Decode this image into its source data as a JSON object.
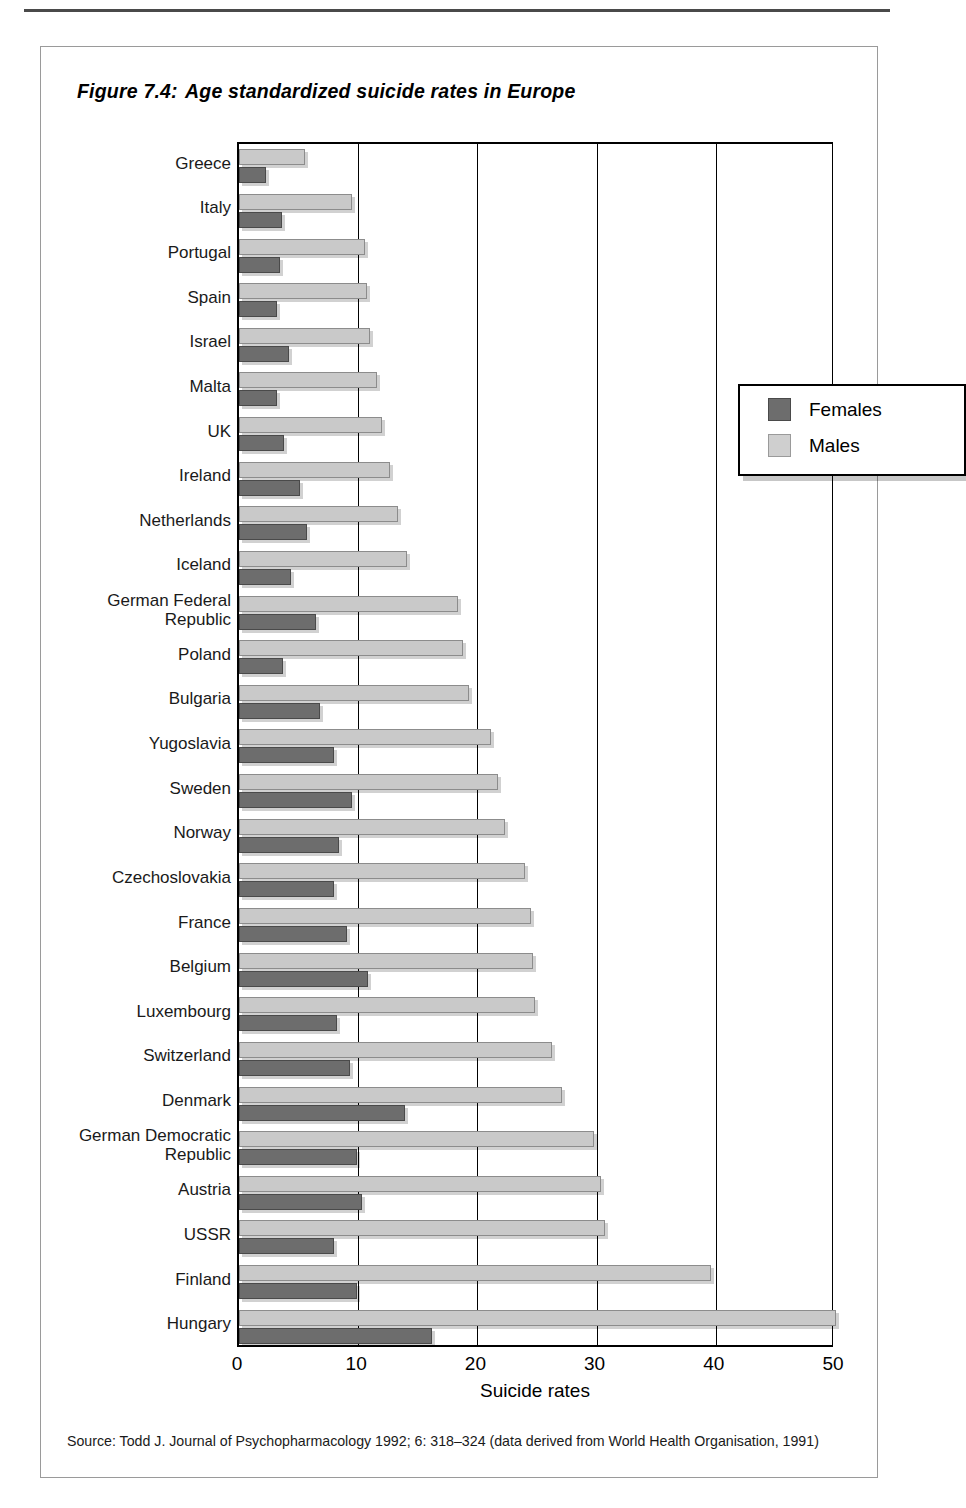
{
  "figure": {
    "number": "Figure 7.4:",
    "title": "Age standardized suicide rates in Europe",
    "source": "Source: Todd J. Journal of Psychopharmacology 1992; 6: 318–324 (data derived from World Health Organisation, 1991)"
  },
  "colors": {
    "females": "#6d6d6d",
    "males": "#c9c9c9",
    "axis": "#000000",
    "frame": "#9a9a9a"
  },
  "legend": {
    "position": "top-right-inside",
    "entries": [
      {
        "label": "Females",
        "color": "#6d6d6d"
      },
      {
        "label": "Males",
        "color": "#c9c9c9"
      }
    ]
  },
  "chart_data": {
    "type": "bar",
    "orientation": "horizontal",
    "title": "Age standardized suicide rates in Europe",
    "xlabel": "Suicide rates",
    "ylabel": "",
    "xlim": [
      0,
      50
    ],
    "xticks": [
      0,
      10,
      20,
      30,
      40,
      50
    ],
    "grid": true,
    "grid_axis": "x",
    "categories": [
      "Greece",
      "Italy",
      "Portugal",
      "Spain",
      "Israel",
      "Malta",
      "UK",
      "Ireland",
      "Netherlands",
      "Iceland",
      "German Federal\nRepublic",
      "Poland",
      "Bulgaria",
      "Yugoslavia",
      "Sweden",
      "Norway",
      "Czechoslovakia",
      "France",
      "Belgium",
      "Luxembourg",
      "Switzerland",
      "Denmark",
      "German Democratic\nRepublic",
      "Austria",
      "USSR",
      "Finland",
      "Hungary"
    ],
    "series": [
      {
        "name": "Males",
        "color": "#c9c9c9",
        "values": [
          5.5,
          9.5,
          10.6,
          10.7,
          11.0,
          11.6,
          12.0,
          12.7,
          13.3,
          14.1,
          18.4,
          18.8,
          19.3,
          21.1,
          21.7,
          22.3,
          24.0,
          24.5,
          24.7,
          24.8,
          26.3,
          27.1,
          29.8,
          30.4,
          30.7,
          39.6,
          50.1
        ]
      },
      {
        "name": "Females",
        "color": "#6d6d6d",
        "values": [
          2.3,
          3.6,
          3.4,
          3.2,
          4.2,
          3.2,
          3.8,
          5.1,
          5.7,
          4.4,
          6.5,
          3.7,
          6.8,
          8.0,
          9.5,
          8.4,
          8.0,
          9.1,
          10.8,
          8.2,
          9.3,
          13.9,
          9.9,
          10.3,
          8.0,
          9.9,
          16.2
        ]
      }
    ]
  }
}
